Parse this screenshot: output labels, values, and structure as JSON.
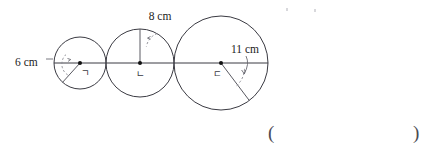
{
  "figure": {
    "type": "geometry-diagram",
    "baseline_y": 63,
    "circles": [
      {
        "id": "circle-ga",
        "center_label": "ㄱ",
        "center_x": 80,
        "center_y": 63,
        "radius_px": 26,
        "measure_label": "6 cm",
        "measure_value": 6,
        "measure_unit": "cm",
        "measure_kind": "radius",
        "label_x": 15,
        "label_y": 62,
        "radius_ray_angle_deg": 228
      },
      {
        "id": "circle-na",
        "center_label": "ㄴ",
        "center_x": 140,
        "center_y": 63,
        "radius_px": 34,
        "measure_label": "8 cm",
        "measure_value": 8,
        "measure_unit": "cm",
        "measure_kind": "radius",
        "label_x": 139,
        "label_y": 20,
        "radius_ray_angle_deg": 270
      },
      {
        "id": "circle-da",
        "center_label": "ㄷ",
        "center_x": 221,
        "center_y": 63,
        "radius_px": 47,
        "measure_label": "11 cm",
        "measure_value": 11,
        "measure_unit": "cm",
        "measure_kind": "radius",
        "label_x": 220,
        "label_y": 54,
        "radius_ray_angle_deg": 53
      }
    ]
  },
  "answer_field": {
    "open_paren": "(",
    "close_paren": ")",
    "value": ""
  }
}
